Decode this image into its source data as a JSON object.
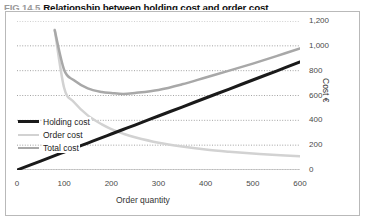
{
  "figure": {
    "number": "FIG 14.5",
    "title": "Relationship between holding cost and order cost"
  },
  "chart_data": {
    "type": "line",
    "title": "Relationship between holding cost and order cost",
    "xlabel": "Order quantity",
    "ylabel": "Cost €",
    "xlim": [
      0,
      600
    ],
    "ylim": [
      0,
      1200
    ],
    "xticks": [
      "0",
      "100",
      "200",
      "300",
      "400",
      "500",
      "600"
    ],
    "xtick_values": [
      0,
      100,
      200,
      300,
      400,
      500,
      600
    ],
    "yticks": [
      "0",
      "200",
      "400",
      "600",
      "800",
      "1,000",
      "1,200"
    ],
    "ytick_values": [
      0,
      200,
      400,
      600,
      800,
      1000,
      1200
    ],
    "grid": "horizontal-dotted",
    "legend_position": "inside-bottom-left",
    "minor_xticks": true,
    "x": [
      0,
      50,
      80,
      100,
      120,
      150,
      180,
      200,
      225,
      250,
      300,
      350,
      400,
      450,
      500,
      550,
      600
    ],
    "series": [
      {
        "name": "Holding cost",
        "color": "#1a1a1a",
        "width": 3,
        "values": [
          0,
          72,
          116,
          145,
          174,
          217,
          261,
          290,
          326,
          362,
          435,
          507,
          580,
          652,
          725,
          797,
          870
        ]
      },
      {
        "name": "Order cost",
        "color": "#d2d2d2",
        "width": 2.5,
        "values": [
          null,
          null,
          1130,
          660,
          550,
          440,
          367,
          330,
          293,
          264,
          220,
          189,
          165,
          147,
          132,
          120,
          110
        ]
      },
      {
        "name": "Total cost",
        "color": "#a8a8a8",
        "width": 2.5,
        "values": [
          null,
          null,
          1125,
          805,
          724,
          657,
          628,
          620,
          612,
          620,
          645,
          690,
          745,
          800,
          857,
          917,
          980
        ]
      }
    ]
  },
  "legend": {
    "items": [
      {
        "label": "Holding cost"
      },
      {
        "label": "Order cost"
      },
      {
        "label": "Total cost"
      }
    ]
  }
}
